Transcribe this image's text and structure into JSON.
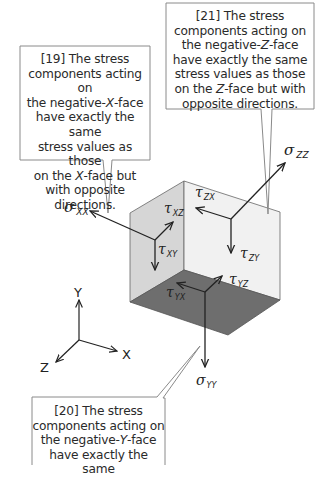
{
  "colors": {
    "background": "#ffffff",
    "callout_border": "#888888",
    "face_negative_x": "#d6d6d6",
    "face_negative_z": "#f1f1f1",
    "face_negative_y": "#6e6e6e",
    "arrow": "#222222",
    "text": "#2a2a2a"
  },
  "callouts": [
    {
      "id": "19",
      "lines": [
        [
          {
            "t": "[19] The stress"
          }
        ],
        [
          {
            "t": "components acting on"
          }
        ],
        [
          {
            "t": "the negative-"
          },
          {
            "t": "X",
            "i": true
          },
          {
            "t": "-face"
          }
        ],
        [
          {
            "t": "have exactly the same"
          }
        ],
        [
          {
            "t": "stress values as those"
          }
        ],
        [
          {
            "t": "on the "
          },
          {
            "t": "X",
            "i": true
          },
          {
            "t": "-face but"
          }
        ],
        [
          {
            "t": "with opposite"
          }
        ],
        [
          {
            "t": "directions."
          }
        ]
      ]
    },
    {
      "id": "21",
      "lines": [
        [
          {
            "t": "[21] The stress"
          }
        ],
        [
          {
            "t": "components acting on"
          }
        ],
        [
          {
            "t": "the negative-"
          },
          {
            "t": "Z",
            "i": true
          },
          {
            "t": "-face"
          }
        ],
        [
          {
            "t": "have exactly the same"
          }
        ],
        [
          {
            "t": "stress values as those"
          }
        ],
        [
          {
            "t": "on the "
          },
          {
            "t": "Z",
            "i": true
          },
          {
            "t": "-face but with"
          }
        ],
        [
          {
            "t": "opposite directions."
          }
        ]
      ]
    },
    {
      "id": "20",
      "lines": [
        [
          {
            "t": "[20] The stress"
          }
        ],
        [
          {
            "t": "components acting on"
          }
        ],
        [
          {
            "t": "the negative-"
          },
          {
            "t": "Y",
            "i": true
          },
          {
            "t": "-face"
          }
        ],
        [
          {
            "t": "have exactly the same"
          }
        ]
      ]
    }
  ],
  "stress_labels": {
    "sigma_xx": {
      "sym": "σ",
      "sub": "XX"
    },
    "tau_xz": {
      "sym": "τ",
      "sub": "XZ"
    },
    "tau_xy": {
      "sym": "τ",
      "sub": "XY"
    },
    "sigma_zz": {
      "sym": "σ",
      "sub": "ZZ"
    },
    "tau_zx": {
      "sym": "τ",
      "sub": "ZX"
    },
    "tau_zy": {
      "sym": "τ",
      "sub": "ZY"
    },
    "tau_yx": {
      "sym": "τ",
      "sub": "YX"
    },
    "tau_yz": {
      "sym": "τ",
      "sub": "YZ"
    },
    "sigma_yy": {
      "sym": "σ",
      "sub": "YY"
    }
  },
  "axes": {
    "x_label": "X",
    "y_label": "Y",
    "z_label": "Z"
  }
}
